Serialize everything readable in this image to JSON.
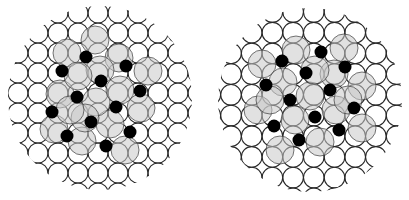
{
  "figure": {
    "panels": [
      {
        "id": "left",
        "cluster_center": [
          100,
          98
        ],
        "cluster_radius": 92,
        "lattice": {
          "origin": [
            18,
            13
          ],
          "spacing": 20,
          "circle_radius": 10
        },
        "black_dots": [
          [
            86,
            57
          ],
          [
            62,
            71
          ],
          [
            126,
            66
          ],
          [
            101,
            81
          ],
          [
            140,
            91
          ],
          [
            77,
            97
          ],
          [
            116,
            107
          ],
          [
            52,
            112
          ],
          [
            91,
            122
          ],
          [
            130,
            132
          ],
          [
            67,
            136
          ],
          [
            106,
            146
          ]
        ],
        "gray_circles": [
          [
            67,
            53
          ],
          [
            95,
            40
          ],
          [
            119,
            58
          ],
          [
            148,
            71
          ],
          [
            141,
            108
          ],
          [
            110,
            124
          ],
          [
            125,
            150
          ],
          [
            82,
            141
          ],
          [
            54,
            129
          ],
          [
            60,
            94
          ],
          [
            96,
            102
          ],
          [
            100,
            70
          ],
          [
            78,
            76
          ],
          [
            120,
            90
          ],
          [
            85,
            118
          ],
          [
            70,
            110
          ]
        ]
      },
      {
        "id": "right",
        "cluster_center": [
          310,
          100
        ],
        "cluster_radius": 92,
        "lattice": {
          "origin": [
            231,
            12
          ],
          "spacing": 20.7,
          "circle_radius": 10.3
        },
        "black_dots": [
          [
            321,
            52
          ],
          [
            282,
            61
          ],
          [
            345,
            67
          ],
          [
            306,
            73
          ],
          [
            266,
            85
          ],
          [
            330,
            90
          ],
          [
            354,
            108
          ],
          [
            290,
            100
          ],
          [
            315,
            117
          ],
          [
            274,
            126
          ],
          [
            339,
            130
          ],
          [
            299,
            140
          ]
        ],
        "gray_circles": [
          [
            262,
            64
          ],
          [
            296,
            50
          ],
          [
            344,
            48
          ],
          [
            362,
            86
          ],
          [
            362,
            128
          ],
          [
            320,
            142
          ],
          [
            280,
            150
          ],
          [
            258,
            110
          ],
          [
            310,
            96
          ],
          [
            283,
            82
          ],
          [
            334,
            74
          ],
          [
            336,
            110
          ],
          [
            295,
            120
          ],
          [
            270,
            100
          ],
          [
            315,
            70
          ],
          [
            348,
            100
          ]
        ]
      }
    ],
    "colors": {
      "stroke": "#2a2a2a",
      "dot": "#000000",
      "gray_fill": "#c8c8c8",
      "background": "#ffffff"
    }
  }
}
